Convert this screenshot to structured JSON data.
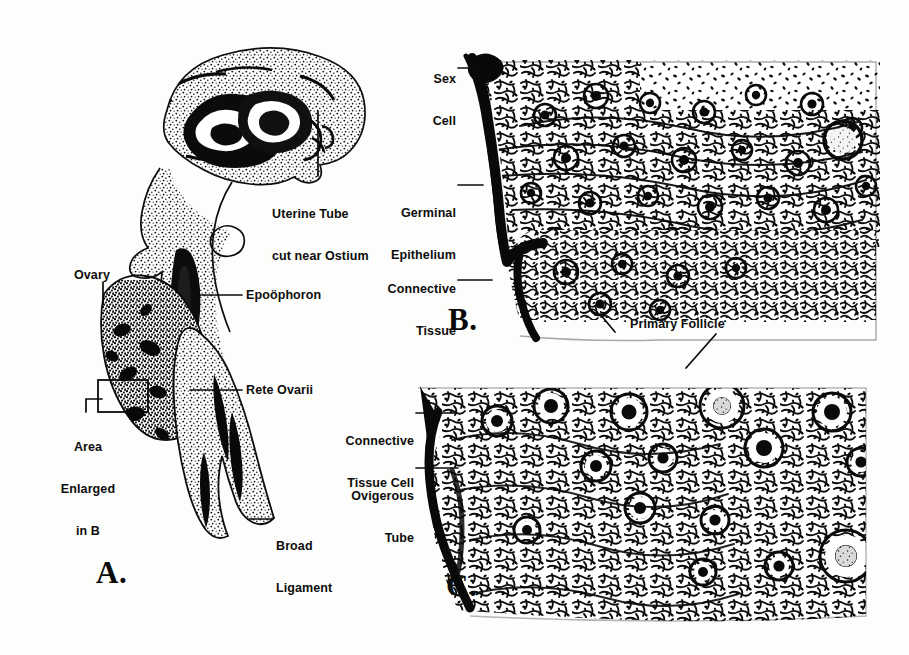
{
  "figure": {
    "background_color": "#fdfdfb",
    "ink_color": "#111111"
  },
  "panels": [
    {
      "id": "A",
      "letter": "A.",
      "caption": "Sagittal section of ovary with uterine tube, epoöphoron and broad ligament",
      "labels": [
        {
          "name": "uterine-tube",
          "text": "Uterine Tube\ncut near Ostium"
        },
        {
          "name": "ovary",
          "text": "Ovary"
        },
        {
          "name": "epoophoron",
          "text": "Epoöphoron"
        },
        {
          "name": "rete-ovarii",
          "text": "Rete Ovarii"
        },
        {
          "name": "area-enlarged-in-b",
          "text": "Area\nEnlarged\nin B"
        },
        {
          "name": "broad-ligament",
          "text": "Broad\nLigament"
        }
      ]
    },
    {
      "id": "B",
      "letter": "B.",
      "caption": "Cortex of ovary enlarged, showing sex cells and germinal epithelium",
      "labels": [
        {
          "name": "sex-cell",
          "text": "Sex\nCell"
        },
        {
          "name": "germinal-epithelium",
          "text": "Germinal\nEpithelium"
        },
        {
          "name": "connective-tissue",
          "text": "Connective\nTissue"
        }
      ]
    },
    {
      "id": "C",
      "letter": "C.",
      "caption": "Ovarian cortex with primary follicles and ovigerous tubes",
      "labels": [
        {
          "name": "primary-follicle",
          "text": "Primary Follicle"
        },
        {
          "name": "connective-tissue-cell",
          "text": "Connective\nTissue Cell"
        },
        {
          "name": "ovigerous-tube",
          "text": "Ovigerous\nTube"
        }
      ]
    }
  ],
  "label_text": {
    "uterine_tube_l1": "Uterine Tube",
    "uterine_tube_l2": "cut near Ostium",
    "ovary": "Ovary",
    "epoophoron": "Epoöphoron",
    "rete_ovarii": "Rete Ovarii",
    "area_l1": "Area",
    "area_l2": "Enlarged",
    "area_l3": "in B",
    "broad_l1": "Broad",
    "broad_l2": "Ligament",
    "sex_l1": "Sex",
    "sex_l2": "Cell",
    "germinal_l1": "Germinal",
    "germinal_l2": "Epithelium",
    "connective_l1": "Connective",
    "connective_l2": "Tissue",
    "primary_follicle": "Primary Follicle",
    "ct_cell_l1": "Connective",
    "ct_cell_l2": "Tissue Cell",
    "ovigerous_l1": "Ovigerous",
    "ovigerous_l2": "Tube",
    "letter_a": "A.",
    "letter_b": "B.",
    "letter_c": "C."
  }
}
